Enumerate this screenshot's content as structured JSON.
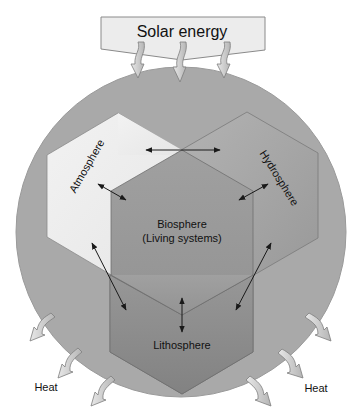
{
  "diagram": {
    "banner": {
      "label": "Solar energy"
    },
    "spheres": {
      "atmosphere": {
        "label": "Atmosphere"
      },
      "hydrosphere": {
        "label": "Hydrosphere"
      },
      "biosphere": {
        "label": "Biosphere",
        "sublabel": "(Living systems)"
      },
      "lithosphere": {
        "label": "Lithosphere"
      }
    },
    "heat": {
      "left_label": "Heat",
      "right_label": "Heat"
    },
    "colors": {
      "circle": "#a9a9a9",
      "banner": "#ececec",
      "atmosphere": "#efefef",
      "hydrosphere": "#a4a4a4",
      "biosphere": "#9a9a9a",
      "lithosphere": "#8e8e8e",
      "arrow_fill": "#c8c8c8",
      "line": "#222222"
    }
  }
}
